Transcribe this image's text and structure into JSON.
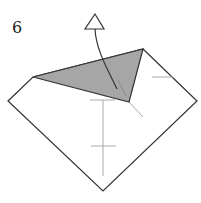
{
  "step": {
    "number": "6"
  },
  "diagram": {
    "paper_outline": [
      [
        8,
        101
      ],
      [
        33,
        77
      ],
      [
        143,
        49
      ],
      [
        197,
        101
      ],
      [
        103,
        191
      ]
    ],
    "shaded_flap": [
      [
        33,
        77
      ],
      [
        143,
        49
      ],
      [
        129,
        102
      ]
    ],
    "colors": {
      "line": "#333333",
      "fill": "#a6a6a6",
      "crease": "#aaaaaa"
    },
    "arrow": {
      "type": "valley-fold-up",
      "tip": [
        95,
        14
      ]
    }
  }
}
